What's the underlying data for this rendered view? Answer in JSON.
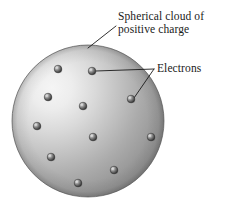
{
  "figure": {
    "kind": "plum-pudding-atomic-model-diagram",
    "background_color": "#ffffff",
    "width": 228,
    "height": 214
  },
  "labels": {
    "cloud": {
      "line1": "Spherical cloud of",
      "line2": "positive charge",
      "text_color": "#1a1a1a",
      "x": 118,
      "y": 10
    },
    "electrons": {
      "text": "Electrons",
      "text_color": "#1a1a1a",
      "x": 157,
      "y": 62
    }
  },
  "sphere": {
    "name": "positive-charge-cloud",
    "center_x": 88,
    "center_y": 121,
    "radius": 76,
    "highlight_x": 52,
    "highlight_y": 88,
    "color_light": "#f2f2f2",
    "color_mid": "#b9b9b9",
    "color_dark": "#8f8f8f",
    "color_edge": "#7d7d7d",
    "outline_color": "#6e6e6e"
  },
  "electrons": {
    "name": "electron-particles",
    "count": 11,
    "radius": 3.8,
    "color_light": "#d8d8d8",
    "color_mid": "#8a8a8a",
    "color_dark": "#3a3a3a",
    "outline_color": "#2b2b2b",
    "positions": [
      {
        "x": 58,
        "y": 69
      },
      {
        "x": 92,
        "y": 71
      },
      {
        "x": 48,
        "y": 97
      },
      {
        "x": 37,
        "y": 126
      },
      {
        "x": 83,
        "y": 106
      },
      {
        "x": 131,
        "y": 99
      },
      {
        "x": 93,
        "y": 137
      },
      {
        "x": 151,
        "y": 137
      },
      {
        "x": 51,
        "y": 157
      },
      {
        "x": 114,
        "y": 170
      },
      {
        "x": 78,
        "y": 183
      }
    ]
  },
  "leader_lines": {
    "color": "#1a1a1a",
    "width": 0.9,
    "cloud": {
      "x1": 116,
      "y1": 26,
      "x2": 88,
      "y2": 48
    },
    "electrons_branch_point": {
      "x": 154,
      "y": 69
    },
    "electrons_upper": {
      "x1": 154,
      "y1": 69,
      "x2": 96,
      "y2": 71
    },
    "electrons_lower": {
      "x1": 154,
      "y1": 69,
      "x2": 134,
      "y2": 98
    }
  }
}
